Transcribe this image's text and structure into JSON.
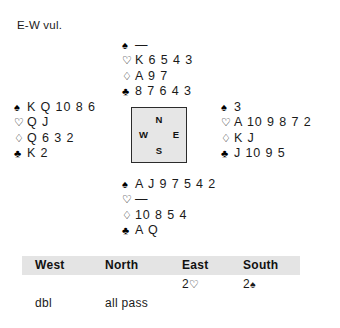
{
  "vulnerability": "E-W vul.",
  "compass": {
    "north": "N",
    "south": "S",
    "west": "W",
    "east": "E"
  },
  "suit_symbols": {
    "spade": "♠",
    "heart": "♡",
    "diamond": "♢",
    "club": "♣",
    "void": "—"
  },
  "hands": {
    "north": {
      "label": "North",
      "spades": "—",
      "hearts": "K 6 5 4 3",
      "diamonds": "A 9 7",
      "clubs": "8 7 6 4 3"
    },
    "west": {
      "label": "West",
      "spades": "K Q 10 8 6",
      "hearts": "Q J",
      "diamonds": "Q 6 3 2",
      "clubs": "K 2"
    },
    "east": {
      "label": "East",
      "spades": "3",
      "hearts": "A 10 9 8 7 2",
      "diamonds": "K J",
      "clubs": "J 10 9 5"
    },
    "south": {
      "label": "South",
      "spades": "A J 9 7 5 4 2",
      "hearts": "—",
      "diamonds": "10 8 5 4",
      "clubs": "A Q"
    }
  },
  "auction": {
    "headers": {
      "west": "West",
      "north": "North",
      "east": "East",
      "south": "South"
    },
    "rows": [
      {
        "west": "",
        "north": "",
        "east_level": "2",
        "east_suit": "♡",
        "south_level": "2",
        "south_suit": "♠"
      },
      {
        "west": "dbl",
        "north": "all pass",
        "east": "",
        "south": ""
      }
    ]
  },
  "colors": {
    "header_band": "#e4e4e4",
    "compass_fill": "#e6e6e6",
    "compass_border": "#2b2b2b",
    "text": "#1a1a1a"
  }
}
